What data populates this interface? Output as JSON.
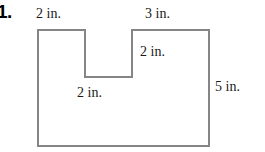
{
  "problem": {
    "number": "1."
  },
  "figure": {
    "name": "notched-rectangle",
    "stroke_color": "#858585",
    "fill_color": "#ffffff",
    "stroke_width": 2,
    "background_color": "#ffffff",
    "unit": "in.",
    "outer": {
      "left": 38,
      "top": 30,
      "right": 209,
      "bottom": 146
    },
    "notch": {
      "left": 85,
      "right": 132,
      "bottom": 77
    },
    "points": "38,30 85,30 85,77 132,77 132,30 209,30 209,146 38,146"
  },
  "labels": {
    "top_left": "2 in.",
    "top_right": "3 in.",
    "inner_right": "2 in.",
    "inner_middle": "2 in.",
    "right_side": "5 in."
  },
  "measurements": {
    "top_left_segment": 2,
    "top_right_segment": 3,
    "notch_depth": 2,
    "notch_width": 2,
    "overall_height": 5,
    "units": "in."
  }
}
